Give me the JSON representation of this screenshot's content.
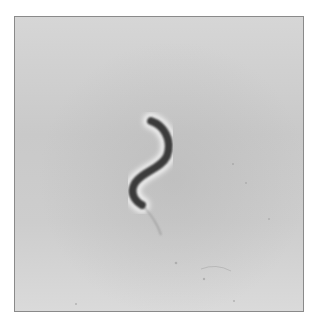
{
  "image": {
    "subject": "spiral bacterium (phase-contrast micrograph)",
    "background_color": "#cfcfcf",
    "cell_color": "#3a3a3a",
    "halo_color": "#efefef",
    "border_color": "#8a8a8a"
  }
}
